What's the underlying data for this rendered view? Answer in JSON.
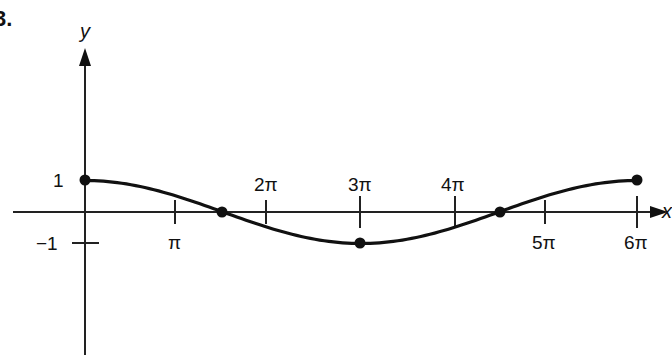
{
  "problem_number": "3.",
  "chart_data": {
    "type": "line",
    "title": "",
    "function": "y = cos(x/3)",
    "xlabel": "x",
    "ylabel": "y",
    "x_ticks": [
      "π",
      "2π",
      "3π",
      "4π",
      "5π",
      "6π"
    ],
    "y_ticks": [
      "1",
      "−1"
    ],
    "xlim": [
      0,
      18.85
    ],
    "ylim": [
      -1,
      1
    ],
    "grid": false,
    "legend": null,
    "marked_points": [
      {
        "x": "0",
        "y": 1
      },
      {
        "x": "3π/2",
        "y": 0
      },
      {
        "x": "3π",
        "y": -1
      },
      {
        "x": "9π/2",
        "y": 0
      },
      {
        "x": "6π",
        "y": 1
      }
    ],
    "x": [
      0,
      1.5708,
      3.1416,
      4.7124,
      6.2832,
      7.854,
      9.4248,
      10.9956,
      12.5664,
      14.1372,
      15.708,
      17.2788,
      18.8496
    ],
    "values": [
      1,
      0.966,
      0.866,
      0.707,
      0.5,
      0.259,
      0,
      -0.259,
      -0.5,
      -0.707,
      -0.866,
      -0.966,
      -1
    ]
  },
  "labels": {
    "y_axis": "y",
    "x_axis": "x",
    "tick_pi": "π",
    "tick_2pi": "2π",
    "tick_3pi": "3π",
    "tick_4pi": "4π",
    "tick_5pi": "5π",
    "tick_6pi": "6π",
    "y_one": "1",
    "y_neg_one": "−1"
  }
}
